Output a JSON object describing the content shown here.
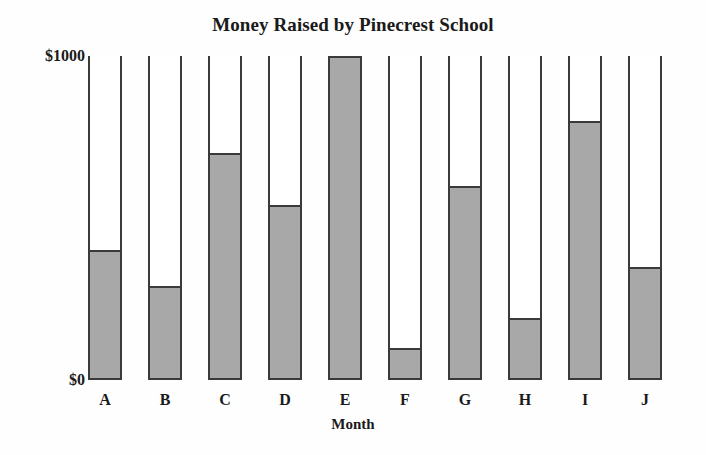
{
  "chart_data": {
    "type": "bar",
    "title": "Money Raised by Pinecrest School",
    "xlabel": "Month",
    "ylabel": "",
    "categories": [
      "A",
      "B",
      "C",
      "D",
      "E",
      "F",
      "G",
      "H",
      "I",
      "J"
    ],
    "values": [
      400,
      290,
      700,
      540,
      1000,
      100,
      600,
      190,
      800,
      350
    ],
    "ylim": [
      0,
      1000
    ],
    "ytick_labels": [
      "$0",
      "$1000"
    ],
    "ytick_values": [
      0,
      1000
    ],
    "grid": false,
    "legend": null,
    "series": [
      {
        "name": "Money Raised",
        "values": [
          400,
          290,
          700,
          540,
          1000,
          100,
          600,
          190,
          800,
          350
        ]
      }
    ],
    "colors": {
      "bar_fill": "#a8a8a8",
      "bar_outline": "#3a3a3a",
      "background": "#fefefe",
      "text": "#1a1a1a"
    }
  }
}
